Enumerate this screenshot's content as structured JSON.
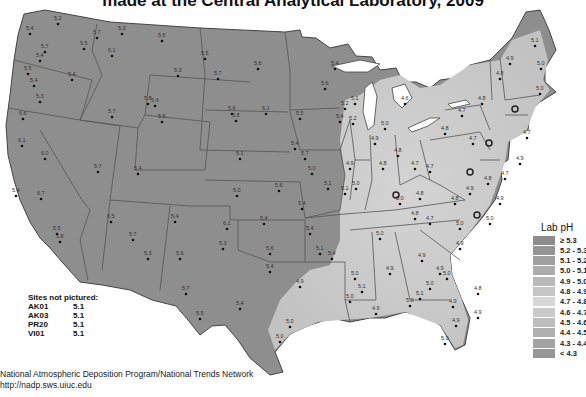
{
  "title": "made at the Central Analytical Laboratory, 2009",
  "legend": {
    "title": "Lab pH",
    "items": [
      {
        "label": "≥ 5.3",
        "color": "#8c8c8c"
      },
      {
        "label": "5.2 - 5.3",
        "color": "#959595"
      },
      {
        "label": "5.1 - 5.2",
        "color": "#a0a0a0"
      },
      {
        "label": "5.0 - 5.1",
        "color": "#acacac"
      },
      {
        "label": "4.9 - 5.0",
        "color": "#b9b9b9"
      },
      {
        "label": "4.8 - 4.9",
        "color": "#c6c6c6"
      },
      {
        "label": "4.7 - 4.8",
        "color": "#d6d6d6"
      },
      {
        "label": "4.6 - 4.7",
        "color": "#cacaca"
      },
      {
        "label": "4.5 - 4.6",
        "color": "#bdbdbd"
      },
      {
        "label": "4.4 - 4.5",
        "color": "#b0b0b0"
      },
      {
        "label": "4.3 - 4.4",
        "color": "#a3a3a3"
      },
      {
        "label": "< 4.3",
        "color": "#969696"
      }
    ]
  },
  "sites_not_pictured": {
    "heading": "Sites not pictured:",
    "rows": [
      {
        "id": "AK01",
        "value": "5.1"
      },
      {
        "id": "AK03",
        "value": "5.1"
      },
      {
        "id": "PR20",
        "value": "5.1"
      },
      {
        "id": "VI01",
        "value": "5.1"
      }
    ]
  },
  "footer": {
    "line1": "National Atmospheric Deposition Program/National Trends Network",
    "line2": "http://nadp.sws.uiuc.edu"
  },
  "map": {
    "base_color": "#8e8e8e",
    "light_color": "#c8c8c8",
    "sites": [
      {
        "x": 30,
        "y": 30,
        "v": "5.4"
      },
      {
        "x": 58,
        "y": 20,
        "v": "5.2"
      },
      {
        "x": 45,
        "y": 48,
        "v": "5.7"
      },
      {
        "x": 40,
        "y": 57,
        "v": "5.4"
      },
      {
        "x": 28,
        "y": 70,
        "v": "5.5"
      },
      {
        "x": 34,
        "y": 82,
        "v": "5.4"
      },
      {
        "x": 72,
        "y": 76,
        "v": "5.4"
      },
      {
        "x": 40,
        "y": 98,
        "v": "5.3"
      },
      {
        "x": 84,
        "y": 45,
        "v": "5.5"
      },
      {
        "x": 97,
        "y": 34,
        "v": "5.7"
      },
      {
        "x": 112,
        "y": 52,
        "v": "6.1"
      },
      {
        "x": 122,
        "y": 30,
        "v": "5.3"
      },
      {
        "x": 162,
        "y": 37,
        "v": "5.6"
      },
      {
        "x": 178,
        "y": 72,
        "v": "5.3"
      },
      {
        "x": 112,
        "y": 113,
        "v": "5.7"
      },
      {
        "x": 148,
        "y": 100,
        "v": "5.8"
      },
      {
        "x": 162,
        "y": 118,
        "v": "5.6"
      },
      {
        "x": 155,
        "y": 102,
        "v": "5.4"
      },
      {
        "x": 23,
        "y": 115,
        "v": "6.6"
      },
      {
        "x": 22,
        "y": 142,
        "v": "6.1"
      },
      {
        "x": 45,
        "y": 155,
        "v": "6.0"
      },
      {
        "x": 16,
        "y": 192,
        "v": "5.4"
      },
      {
        "x": 41,
        "y": 195,
        "v": "6.7"
      },
      {
        "x": 57,
        "y": 230,
        "v": "5.5"
      },
      {
        "x": 60,
        "y": 238,
        "v": "5.8"
      },
      {
        "x": 98,
        "y": 168,
        "v": "5.7"
      },
      {
        "x": 111,
        "y": 218,
        "v": "6.5"
      },
      {
        "x": 133,
        "y": 236,
        "v": "5.7"
      },
      {
        "x": 138,
        "y": 170,
        "v": "5.4"
      },
      {
        "x": 175,
        "y": 218,
        "v": "5.4"
      },
      {
        "x": 148,
        "y": 255,
        "v": "5.3"
      },
      {
        "x": 180,
        "y": 255,
        "v": "5.6"
      },
      {
        "x": 205,
        "y": 55,
        "v": "5.5"
      },
      {
        "x": 258,
        "y": 65,
        "v": "5.6"
      },
      {
        "x": 218,
        "y": 75,
        "v": "5.7"
      },
      {
        "x": 266,
        "y": 110,
        "v": "6.1"
      },
      {
        "x": 232,
        "y": 110,
        "v": "5.6"
      },
      {
        "x": 236,
        "y": 117,
        "v": "5.8"
      },
      {
        "x": 240,
        "y": 155,
        "v": "5.1"
      },
      {
        "x": 295,
        "y": 145,
        "v": "5.4"
      },
      {
        "x": 237,
        "y": 192,
        "v": "5.0"
      },
      {
        "x": 279,
        "y": 187,
        "v": "5.6"
      },
      {
        "x": 302,
        "y": 205,
        "v": "5.4"
      },
      {
        "x": 227,
        "y": 225,
        "v": "6.1"
      },
      {
        "x": 264,
        "y": 220,
        "v": "5.4"
      },
      {
        "x": 223,
        "y": 245,
        "v": "5.3"
      },
      {
        "x": 270,
        "y": 250,
        "v": "5.6"
      },
      {
        "x": 270,
        "y": 268,
        "v": "5.4"
      },
      {
        "x": 305,
        "y": 155,
        "v": "5.7"
      },
      {
        "x": 312,
        "y": 170,
        "v": "5.0"
      },
      {
        "x": 328,
        "y": 185,
        "v": "5.1"
      },
      {
        "x": 345,
        "y": 190,
        "v": "5.1"
      },
      {
        "x": 310,
        "y": 230,
        "v": "5.4"
      },
      {
        "x": 320,
        "y": 250,
        "v": "5.1"
      },
      {
        "x": 332,
        "y": 255,
        "v": "5.4"
      },
      {
        "x": 335,
        "y": 65,
        "v": "5.4"
      },
      {
        "x": 325,
        "y": 85,
        "v": "5.6"
      },
      {
        "x": 300,
        "y": 115,
        "v": "5.5"
      },
      {
        "x": 340,
        "y": 118,
        "v": "5.4"
      },
      {
        "x": 355,
        "y": 100,
        "v": "5.1"
      },
      {
        "x": 345,
        "y": 105,
        "v": "5.2"
      },
      {
        "x": 353,
        "y": 120,
        "v": "5.2"
      },
      {
        "x": 350,
        "y": 165,
        "v": "4.9"
      },
      {
        "x": 356,
        "y": 185,
        "v": "5.0"
      },
      {
        "x": 375,
        "y": 140,
        "v": "4.9"
      },
      {
        "x": 385,
        "y": 125,
        "v": "5.0"
      },
      {
        "x": 398,
        "y": 152,
        "v": "4.8"
      },
      {
        "x": 383,
        "y": 165,
        "v": "4.8"
      },
      {
        "x": 415,
        "y": 165,
        "v": "4.7"
      },
      {
        "x": 430,
        "y": 168,
        "v": "4.7"
      },
      {
        "x": 405,
        "y": 100,
        "v": "4.6"
      },
      {
        "x": 445,
        "y": 130,
        "v": "4.8"
      },
      {
        "x": 462,
        "y": 112,
        "v": "4.7"
      },
      {
        "x": 482,
        "y": 100,
        "v": "4.8"
      },
      {
        "x": 473,
        "y": 140,
        "v": "4.7"
      },
      {
        "x": 500,
        "y": 75,
        "v": "4.8"
      },
      {
        "x": 510,
        "y": 60,
        "v": "4.9"
      },
      {
        "x": 535,
        "y": 42,
        "v": "5.1"
      },
      {
        "x": 541,
        "y": 65,
        "v": "5.0"
      },
      {
        "x": 540,
        "y": 90,
        "v": "5.0"
      },
      {
        "x": 527,
        "y": 134,
        "v": "4.7"
      },
      {
        "x": 520,
        "y": 160,
        "v": "4.9"
      },
      {
        "x": 505,
        "y": 175,
        "v": "4.7"
      },
      {
        "x": 488,
        "y": 180,
        "v": "4.8"
      },
      {
        "x": 470,
        "y": 190,
        "v": "4.9"
      },
      {
        "x": 455,
        "y": 200,
        "v": "4.8"
      },
      {
        "x": 420,
        "y": 195,
        "v": "4.8"
      },
      {
        "x": 400,
        "y": 200,
        "v": "5.0"
      },
      {
        "x": 415,
        "y": 215,
        "v": "4.8"
      },
      {
        "x": 500,
        "y": 200,
        "v": "4.9"
      },
      {
        "x": 490,
        "y": 220,
        "v": "5.0"
      },
      {
        "x": 460,
        "y": 225,
        "v": "5.0"
      },
      {
        "x": 430,
        "y": 220,
        "v": "4.7"
      },
      {
        "x": 380,
        "y": 235,
        "v": "5.0"
      },
      {
        "x": 460,
        "y": 245,
        "v": "4.9"
      },
      {
        "x": 422,
        "y": 257,
        "v": "4.9"
      },
      {
        "x": 440,
        "y": 270,
        "v": "4.9"
      },
      {
        "x": 420,
        "y": 295,
        "v": "5.1"
      },
      {
        "x": 447,
        "y": 275,
        "v": "5.0"
      },
      {
        "x": 430,
        "y": 285,
        "v": "5.0"
      },
      {
        "x": 390,
        "y": 270,
        "v": "4.9"
      },
      {
        "x": 355,
        "y": 275,
        "v": "5.0"
      },
      {
        "x": 362,
        "y": 288,
        "v": "5.1"
      },
      {
        "x": 410,
        "y": 302,
        "v": "5.0"
      },
      {
        "x": 453,
        "y": 303,
        "v": "4.9"
      },
      {
        "x": 456,
        "y": 322,
        "v": "4.9"
      },
      {
        "x": 445,
        "y": 340,
        "v": "5.0"
      },
      {
        "x": 478,
        "y": 314,
        "v": "4.9"
      },
      {
        "x": 478,
        "y": 290,
        "v": "4.8"
      },
      {
        "x": 376,
        "y": 310,
        "v": "4.9"
      },
      {
        "x": 350,
        "y": 298,
        "v": "5.0"
      },
      {
        "x": 300,
        "y": 283,
        "v": "4.9"
      },
      {
        "x": 290,
        "y": 323,
        "v": "5.0"
      },
      {
        "x": 280,
        "y": 338,
        "v": "5.0"
      },
      {
        "x": 240,
        "y": 305,
        "v": "5.4"
      },
      {
        "x": 200,
        "y": 315,
        "v": "5.5"
      },
      {
        "x": 186,
        "y": 290,
        "v": "5.7"
      }
    ]
  }
}
